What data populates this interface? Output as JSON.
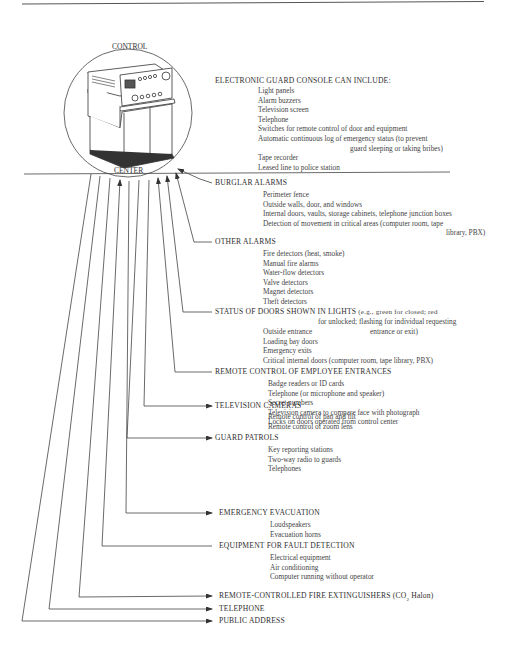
{
  "console": {
    "label_top": "CONTROL",
    "label_bottom": "CENTER",
    "title": "ELECTRONIC GUARD CONSOLE CAN INCLUDE:",
    "items": [
      "Light panels",
      "Alarm buzzers",
      "Television screen",
      "Telephone",
      "Switches for remote control of door and equipment",
      "Automatic continuous log of emergency status (to prevent",
      "guard sleeping or taking bribes)",
      "Tape recorder",
      "Leased line to police station"
    ]
  },
  "sections": [
    {
      "title": "BURGLAR ALARMS",
      "direction": "inbound",
      "items": [
        "Perimeter fence",
        "Outside walls, door, and windows",
        "Internal doors, vaults, storage cabinets, telephone junction boxes",
        "Detection of movement in critical areas (computer room, tape",
        "library, PBX)"
      ]
    },
    {
      "title": "OTHER ALARMS",
      "direction": "inbound",
      "items": [
        "Fire detectors (heat, smoke)",
        "Manual fire alarms",
        "Water-flow detectors",
        "Valve detectors",
        "Magnet detectors",
        "Theft detectors"
      ]
    },
    {
      "title": "STATUS OF DOORS SHOWN IN LIGHTS",
      "title_note_1": "(e.g., green for closed; red",
      "title_note_2": "for unlocked; flashing for individual requesting",
      "title_note_3": "entrance or exit)",
      "direction": "inbound",
      "items": [
        "Outside entrance",
        "Loading bay doors",
        "Emergency exits",
        "Critical internal doors (computer room, tape library, PBX)"
      ]
    },
    {
      "title": "REMOTE CONTROL OF EMPLOYEE ENTRANCES",
      "direction": "inbound",
      "items": [
        "Badge readers or ID cards",
        "Telephone (or microphone and speaker)",
        "Secret numbers",
        "Television camera to compare face with photograph",
        "Locks on doors operated from control center"
      ]
    },
    {
      "title": "TELEVISION CAMERAS",
      "direction": "outbound",
      "items": [
        "Remote control of pan and tilt",
        "Remote control of zoom lens"
      ]
    },
    {
      "title": "GUARD PATROLS",
      "direction": "outbound",
      "items": [
        "Key reporting stations",
        "Two-way radio to guards",
        "Telephones"
      ]
    },
    {
      "title": "EMERGENCY EVACUATION",
      "direction": "outbound",
      "items": [
        "Loudspeakers",
        "Evacuation horns"
      ]
    },
    {
      "title": "EQUIPMENT FOR FAULT DETECTION",
      "direction": "inbound",
      "items": [
        "Electrical equipment",
        "Air conditioning",
        "Computer running without operator"
      ]
    },
    {
      "title": "REMOTE-CONTROLLED FIRE EXTINGUISHERS (CO",
      "title_sub": "2",
      "title_tail": " Halon)",
      "direction": "outbound",
      "items": []
    },
    {
      "title": "TELEPHONE",
      "direction": "outbound",
      "items": []
    },
    {
      "title": "PUBLIC ADDRESS",
      "direction": "outbound",
      "items": []
    }
  ]
}
